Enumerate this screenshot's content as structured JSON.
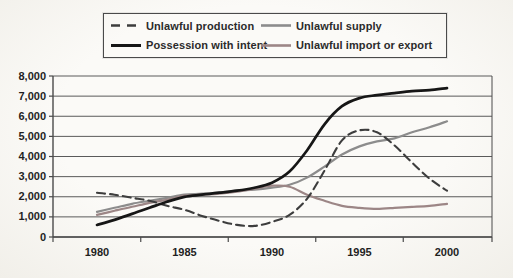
{
  "page": {
    "background_hint": "scanned-paper"
  },
  "legend": {
    "items": [
      {
        "label": "Unlawful production"
      },
      {
        "label": "Unlawful supply"
      },
      {
        "label": "Possession with intent"
      },
      {
        "label": "Unlawful import or export"
      }
    ]
  },
  "chart_data": {
    "type": "line",
    "title": "",
    "xlabel": "",
    "ylabel": "",
    "x": [
      1980,
      1981,
      1982,
      1983,
      1984,
      1985,
      1986,
      1987,
      1988,
      1989,
      1990,
      1991,
      1992,
      1993,
      1994,
      1995,
      1996,
      1997,
      1998,
      1999,
      2000
    ],
    "x_tick_labels": [
      "1980",
      "1985",
      "1990",
      "1995",
      "2000"
    ],
    "x_label_years": [
      1980,
      1985,
      1990,
      1995,
      2000
    ],
    "y_tick_labels": [
      "0",
      "1,000",
      "2,000",
      "3,000",
      "4,000",
      "5,000",
      "6,000",
      "7,000",
      "8,000"
    ],
    "ylim": [
      0,
      8000
    ],
    "y_step": 1000,
    "grid": true,
    "legend_position": "top",
    "axis_color": "#4a4a4a",
    "grid_color": "#5a5a5a",
    "series": [
      {
        "name": "Unlawful production",
        "color": "#3d3d3d",
        "dash": "8 5",
        "width": 2.1,
        "values": [
          2200,
          2100,
          1950,
          1800,
          1550,
          1350,
          1050,
          800,
          600,
          550,
          750,
          1100,
          1900,
          3300,
          4800,
          5300,
          5200,
          4550,
          3700,
          2900,
          2300
        ]
      },
      {
        "name": "Possession with intent",
        "color": "#161616",
        "dash": "",
        "width": 2.7,
        "values": [
          600,
          850,
          1150,
          1450,
          1750,
          2000,
          2100,
          2200,
          2300,
          2450,
          2700,
          3250,
          4300,
          5600,
          6500,
          6900,
          7050,
          7150,
          7250,
          7300,
          7400
        ]
      },
      {
        "name": "Unlawful supply",
        "color": "#8c8c8c",
        "dash": "",
        "width": 2.2,
        "values": [
          1250,
          1450,
          1650,
          1800,
          1950,
          2100,
          2150,
          2200,
          2300,
          2350,
          2450,
          2600,
          2950,
          3500,
          4100,
          4500,
          4750,
          4900,
          5200,
          5450,
          5750
        ]
      },
      {
        "name": "Unlawful import or export",
        "color": "#9c8686",
        "dash": "",
        "width": 2.2,
        "values": [
          1100,
          1300,
          1500,
          1700,
          1850,
          2050,
          2100,
          2150,
          2250,
          2400,
          2550,
          2500,
          2100,
          1800,
          1550,
          1450,
          1400,
          1450,
          1500,
          1550,
          1650
        ]
      }
    ]
  }
}
